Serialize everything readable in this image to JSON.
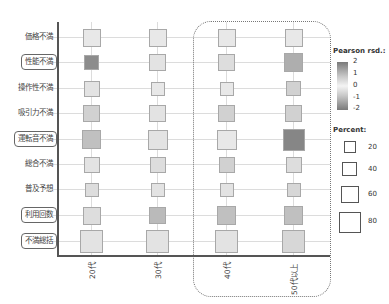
{
  "chart_data": {
    "type": "heatmap",
    "subtype": "mosaic-residual-square-plot",
    "rows": [
      "価格不満",
      "性能不満",
      "操作性不満",
      "吸引力不満",
      "運転音不満",
      "総合不満",
      "普及予想",
      "利用回数",
      "不満総括"
    ],
    "highlighted_rows": [
      "性能不満",
      "運転音不満",
      "利用回数",
      "不満総括"
    ],
    "columns": [
      "20代",
      "30代",
      "40代",
      "50代以上"
    ],
    "highlighted_columns": [
      "40代",
      "50代以上"
    ],
    "percent": [
      [
        30,
        30,
        30,
        30
      ],
      [
        22,
        27,
        27,
        33
      ],
      [
        23,
        17,
        17,
        20
      ],
      [
        25,
        27,
        27,
        27
      ],
      [
        33,
        38,
        38,
        45
      ],
      [
        23,
        23,
        23,
        23
      ],
      [
        17,
        17,
        17,
        17
      ],
      [
        30,
        27,
        33,
        33
      ],
      [
        47,
        48,
        50,
        50
      ]
    ],
    "pearson_residuals": [
      [
        -0.2,
        -0.2,
        -0.2,
        -0.2
      ],
      [
        1.8,
        -0.3,
        -0.4,
        1.2
      ],
      [
        -0.3,
        -0.2,
        -0.2,
        -0.6
      ],
      [
        -0.6,
        -0.3,
        -0.6,
        -0.6
      ],
      [
        0.9,
        -0.3,
        -0.2,
        1.9
      ],
      [
        -0.3,
        -0.4,
        -0.6,
        -0.4
      ],
      [
        -0.4,
        -0.3,
        -0.3,
        -0.5
      ],
      [
        -0.4,
        1.0,
        0.9,
        0.9
      ],
      [
        -0.3,
        -0.3,
        -0.3,
        -0.5
      ]
    ],
    "legend": {
      "color_title": "Pearson rsd.:",
      "color_ticks": [
        "2",
        "1",
        "0",
        "-1",
        "-2"
      ],
      "size_title": "Percent:",
      "size_ticks": [
        "20",
        "40",
        "60",
        "80"
      ]
    },
    "xlabel": "",
    "ylabel": "",
    "grid": true
  },
  "legend": {
    "color_title": "Pearson rsd.:",
    "color_ticks": [
      "2",
      "1",
      "0",
      "-1",
      "-2"
    ],
    "size_title": "Percent:",
    "size_ticks": [
      "20",
      "40",
      "60",
      "80"
    ]
  },
  "rows": [
    "価格不満",
    "性能不満",
    "操作性不満",
    "吸引力不満",
    "運転音不満",
    "総合不満",
    "普及予想",
    "利用回数",
    "不満総括"
  ],
  "columns": [
    "20代",
    "30代",
    "40代",
    "50代以上"
  ]
}
